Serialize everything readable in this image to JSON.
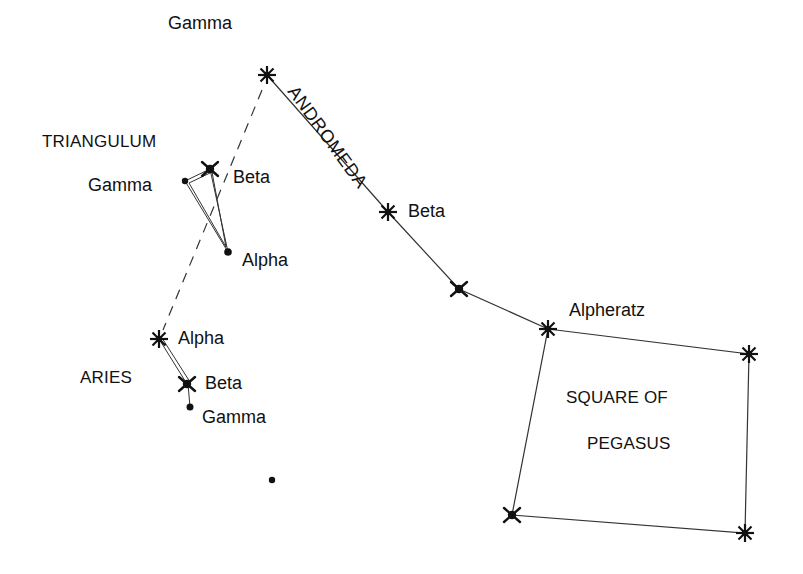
{
  "diagram": {
    "type": "star-chart",
    "constellations": [
      {
        "name": "ANDROMEDA",
        "stars": [
          {
            "label": "Gamma",
            "x": 267,
            "y": 75,
            "shape": "asterisk"
          },
          {
            "label": "Beta",
            "x": 388,
            "y": 212,
            "shape": "asterisk"
          },
          {
            "label": "",
            "x": 459,
            "y": 289,
            "shape": "cross"
          },
          {
            "label": "Alpheratz",
            "x": 548,
            "y": 329,
            "shape": "asterisk"
          }
        ]
      },
      {
        "name": "SQUARE OF PEGASUS",
        "line1": "SQUARE OF",
        "line2": "PEGASUS",
        "stars": [
          {
            "label": "Alpheratz",
            "x": 548,
            "y": 329
          },
          {
            "label": "",
            "x": 749,
            "y": 354,
            "shape": "asterisk"
          },
          {
            "label": "",
            "x": 745,
            "y": 533,
            "shape": "asterisk"
          },
          {
            "label": "",
            "x": 512,
            "y": 515,
            "shape": "cross"
          }
        ]
      },
      {
        "name": "TRIANGULUM",
        "stars": [
          {
            "label": "Beta",
            "x": 210,
            "y": 169,
            "shape": "cross"
          },
          {
            "label": "Gamma",
            "x": 185,
            "y": 181,
            "shape": "dot"
          },
          {
            "label": "Alpha",
            "x": 228,
            "y": 252,
            "shape": "dot"
          }
        ]
      },
      {
        "name": "ARIES",
        "stars": [
          {
            "label": "Alpha",
            "x": 159,
            "y": 339,
            "shape": "asterisk"
          },
          {
            "label": "Beta",
            "x": 187,
            "y": 384,
            "shape": "cross"
          },
          {
            "label": "Gamma",
            "x": 190,
            "y": 407,
            "shape": "dot"
          }
        ]
      }
    ],
    "other_stars": [
      {
        "x": 272,
        "y": 480,
        "shape": "dot"
      }
    ],
    "guide_line": {
      "from": "Gamma Andromedae",
      "to": "Alpha Arietis",
      "style": "dashed"
    },
    "labels": {
      "andromeda_title": "ANDROMEDA",
      "triangulum_title": "TRIANGULUM",
      "aries_title": "ARIES",
      "pegasus_line1": "SQUARE OF",
      "pegasus_line2": "PEGASUS",
      "and_gamma": "Gamma",
      "and_beta": "Beta",
      "alpheratz": "Alpheratz",
      "tri_gamma": "Gamma",
      "tri_beta": "Beta",
      "tri_alpha": "Alpha",
      "ari_alpha": "Alpha",
      "ari_beta": "Beta",
      "ari_gamma": "Gamma"
    },
    "colors": {
      "ink": "#111111",
      "line": "#333333",
      "background": "#ffffff"
    }
  }
}
